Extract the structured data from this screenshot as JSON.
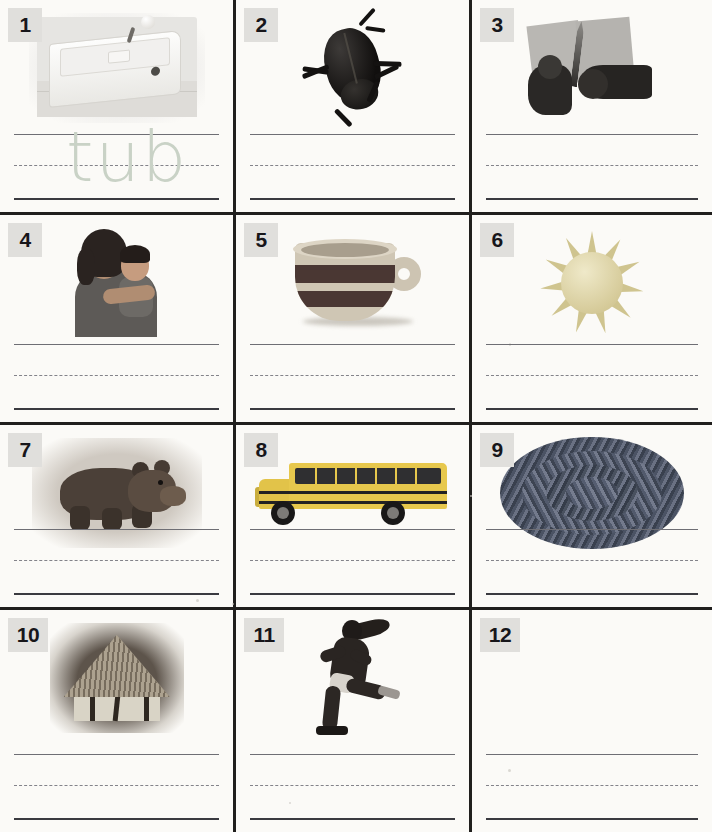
{
  "page": {
    "type": "phonics-picture-word-worksheet",
    "rows": 4,
    "columns": 3,
    "total_cells": 12,
    "background_color": "#fbfaf7",
    "grid_line_color": "#201f1d",
    "badge_background": "#e0dfdc",
    "rule_line_solid_color": "#6e6e74",
    "rule_line_baseline_color": "#3a3a40",
    "rule_line_dashed_color": "#83838a",
    "handwriting_color": "#c9d2c6"
  },
  "cells": [
    {
      "number": "1",
      "image": "bathtub-photo",
      "image_label": "bathtub",
      "answer": "tub",
      "has_answer": true,
      "has_image": true
    },
    {
      "number": "2",
      "image": "beetle-photo",
      "image_label": "black beetle bug",
      "answer": "",
      "has_answer": false,
      "has_image": true
    },
    {
      "number": "3",
      "image": "hands-cutting-photo",
      "image_label": "hands cutting paper with scissors",
      "answer": "",
      "has_answer": false,
      "has_image": true
    },
    {
      "number": "4",
      "image": "mother-and-baby-photo",
      "image_label": "mother hugging baby",
      "answer": "",
      "has_answer": false,
      "has_image": true
    },
    {
      "number": "5",
      "image": "cup-photo",
      "image_label": "striped cup with handle",
      "answer": "",
      "has_answer": false,
      "has_image": true
    },
    {
      "number": "6",
      "image": "sun-illustration",
      "image_label": "sun with rays",
      "answer": "",
      "has_answer": false,
      "has_image": true
    },
    {
      "number": "7",
      "image": "bear-photo",
      "image_label": "brown bear cub",
      "answer": "",
      "has_answer": false,
      "has_image": true
    },
    {
      "number": "8",
      "image": "school-bus-photo",
      "image_label": "yellow school bus",
      "answer": "",
      "has_answer": false,
      "has_image": true
    },
    {
      "number": "9",
      "image": "braided-rug-photo",
      "image_label": "oval braided rug",
      "answer": "",
      "has_answer": false,
      "has_image": true
    },
    {
      "number": "10",
      "image": "thatched-hut-photo",
      "image_label": "thatched roof hut",
      "answer": "",
      "has_answer": false,
      "has_image": true
    },
    {
      "number": "11",
      "image": "running-girl-photo",
      "image_label": "girl running",
      "answer": "",
      "has_answer": false,
      "has_image": true
    },
    {
      "number": "12",
      "image": "",
      "image_label": "",
      "answer": "",
      "has_answer": false,
      "has_image": false
    }
  ]
}
